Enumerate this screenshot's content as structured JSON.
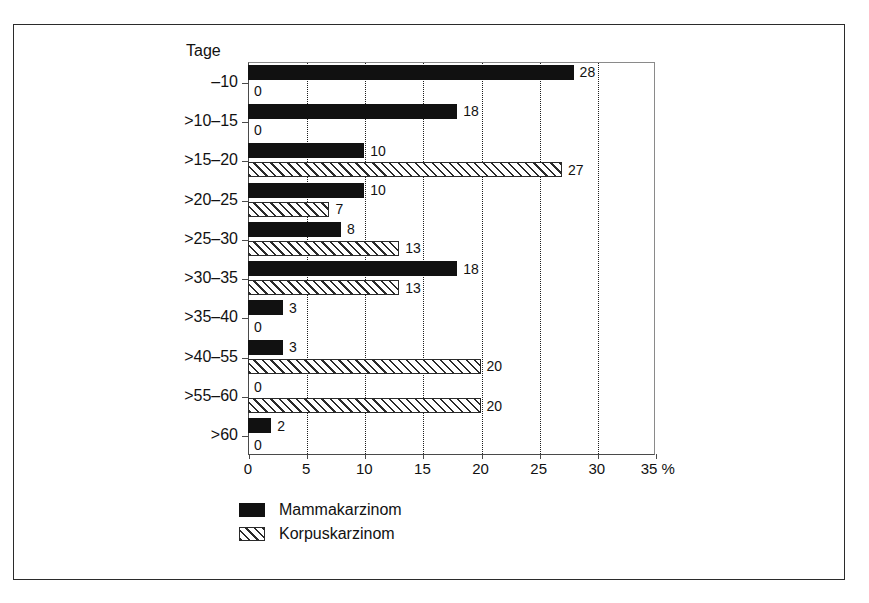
{
  "chart_data": {
    "type": "bar",
    "orientation": "horizontal",
    "title": "",
    "xlabel": "%",
    "ylabel": "Tage",
    "xlim": [
      0,
      35
    ],
    "xticks": [
      0,
      5,
      10,
      15,
      20,
      25,
      30,
      35
    ],
    "xtick_labels": [
      "0",
      "5",
      "10",
      "15",
      "20",
      "25",
      "30",
      "35"
    ],
    "x_axis_unit": "%",
    "grid": "vertical-dotted",
    "legend_position": "bottom-left",
    "categories": [
      "–10",
      ">10–15",
      ">15–20",
      ">20–25",
      ">25–30",
      ">30–35",
      ">35–40",
      ">40–55",
      ">55–60",
      ">60"
    ],
    "series": [
      {
        "name": "Mammakarzinom",
        "pattern": "solid",
        "color": "#111111",
        "values": [
          28,
          18,
          10,
          10,
          8,
          18,
          3,
          3,
          0,
          2
        ]
      },
      {
        "name": "Korpuskarzinom",
        "pattern": "hatched",
        "color": "#2a2a2a",
        "values": [
          0,
          0,
          27,
          7,
          13,
          13,
          0,
          20,
          20,
          0
        ]
      }
    ]
  },
  "axis": {
    "y_title": "Tage",
    "x_unit_label": "%"
  },
  "legend": {
    "items": [
      {
        "label": "Mammakarzinom",
        "swatch": "solid-black-swatch"
      },
      {
        "label": "Korpuskarzinom",
        "swatch": "hatched-swatch"
      }
    ]
  }
}
